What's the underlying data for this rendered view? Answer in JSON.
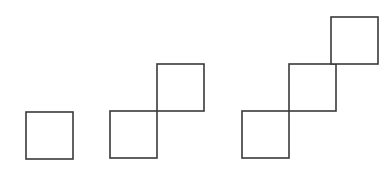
{
  "canvas": {
    "width": 389,
    "height": 176,
    "background_color": "#ffffff"
  },
  "style": {
    "stroke_color": "#3a3a3a",
    "stroke_width": 1.6,
    "fill_color": "#ffffff",
    "square_size": 47
  },
  "figures": [
    {
      "name": "figure-1",
      "term_number": 1,
      "square_count": 1,
      "squares": [
        {
          "name": "square-1-1",
          "x": 26,
          "y": 112,
          "size": 47
        }
      ]
    },
    {
      "name": "figure-2",
      "term_number": 2,
      "square_count": 2,
      "squares": [
        {
          "name": "square-2-1",
          "x": 110,
          "y": 111,
          "size": 47
        },
        {
          "name": "square-2-2",
          "x": 157,
          "y": 64,
          "size": 47
        }
      ]
    },
    {
      "name": "figure-3",
      "term_number": 3,
      "square_count": 3,
      "squares": [
        {
          "name": "square-3-1",
          "x": 242,
          "y": 111,
          "size": 47
        },
        {
          "name": "square-3-2",
          "x": 289,
          "y": 64,
          "size": 47
        },
        {
          "name": "square-3-3",
          "x": 331,
          "y": 17,
          "size": 47
        }
      ]
    }
  ]
}
